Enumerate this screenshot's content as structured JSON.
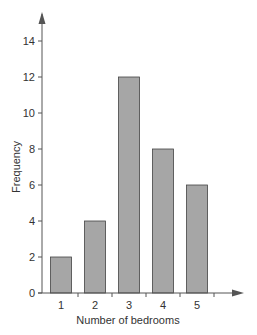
{
  "chart_data": {
    "type": "bar",
    "title": "",
    "xlabel": "Number of bedrooms",
    "ylabel": "Frequency",
    "categories": [
      "1",
      "2",
      "3",
      "4",
      "5"
    ],
    "values": [
      2,
      4,
      12,
      8,
      6
    ],
    "ylim": [
      0,
      14
    ],
    "yticks": [
      0,
      2,
      4,
      6,
      8,
      10,
      12,
      14
    ],
    "grid": false,
    "legend": null,
    "bar_color": "#a6a6a6",
    "bar_edge_color": "#444444",
    "axis_color": "#555555"
  }
}
